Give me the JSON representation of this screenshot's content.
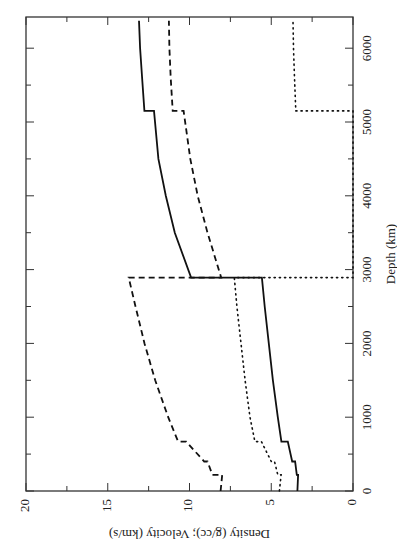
{
  "chart_data": {
    "type": "line",
    "title": "",
    "orientation": "rotated-90",
    "xlabel": "Depth (km)",
    "ylabel": "Density (g/cc); Velocity (km/s)",
    "xlim": [
      0,
      6371
    ],
    "ylim": [
      0,
      20
    ],
    "x_ticks": [
      0,
      1000,
      2000,
      3000,
      4000,
      5000,
      6000
    ],
    "x_tick_labels": [
      "0",
      "1000",
      "2000",
      "3000",
      "4000",
      "5000",
      "6000"
    ],
    "y_ticks": [
      0,
      5,
      10,
      15,
      20
    ],
    "y_tick_labels": [
      "0",
      "5",
      "10",
      "15",
      "20"
    ],
    "grid": false,
    "legend": null,
    "series": [
      {
        "name": "Density",
        "style": "solid",
        "points": [
          [
            0,
            3.4
          ],
          [
            220,
            3.36
          ],
          [
            220,
            3.44
          ],
          [
            400,
            3.54
          ],
          [
            400,
            3.72
          ],
          [
            670,
            3.99
          ],
          [
            670,
            4.38
          ],
          [
            1000,
            4.6
          ],
          [
            1500,
            4.9
          ],
          [
            2000,
            5.15
          ],
          [
            2500,
            5.4
          ],
          [
            2891,
            5.57
          ],
          [
            2891,
            9.9
          ],
          [
            3500,
            10.9
          ],
          [
            4000,
            11.45
          ],
          [
            4500,
            11.9
          ],
          [
            5150,
            12.17
          ],
          [
            5150,
            12.76
          ],
          [
            5600,
            12.9
          ],
          [
            6000,
            13.02
          ],
          [
            6371,
            13.09
          ]
        ]
      },
      {
        "name": "P-wave velocity",
        "style": "dashed",
        "points": [
          [
            0,
            8.1
          ],
          [
            220,
            8.0
          ],
          [
            220,
            8.6
          ],
          [
            400,
            8.9
          ],
          [
            400,
            9.1
          ],
          [
            670,
            10.2
          ],
          [
            670,
            10.7
          ],
          [
            1000,
            11.3
          ],
          [
            1500,
            12.1
          ],
          [
            2000,
            12.75
          ],
          [
            2500,
            13.3
          ],
          [
            2891,
            13.72
          ],
          [
            2891,
            8.06
          ],
          [
            3500,
            8.9
          ],
          [
            4000,
            9.5
          ],
          [
            4500,
            9.95
          ],
          [
            5150,
            10.36
          ],
          [
            5150,
            11.03
          ],
          [
            5600,
            11.15
          ],
          [
            6000,
            11.23
          ],
          [
            6371,
            11.26
          ]
        ]
      },
      {
        "name": "S-wave velocity",
        "style": "dotted",
        "points": [
          [
            0,
            4.5
          ],
          [
            220,
            4.4
          ],
          [
            220,
            4.6
          ],
          [
            400,
            4.8
          ],
          [
            400,
            5.0
          ],
          [
            670,
            5.6
          ],
          [
            670,
            6.0
          ],
          [
            1000,
            6.3
          ],
          [
            1500,
            6.6
          ],
          [
            2000,
            6.85
          ],
          [
            2500,
            7.1
          ],
          [
            2891,
            7.26
          ],
          [
            2891,
            0
          ],
          [
            5150,
            0
          ],
          [
            5150,
            3.5
          ],
          [
            5600,
            3.58
          ],
          [
            6000,
            3.64
          ],
          [
            6371,
            3.67
          ]
        ]
      }
    ]
  }
}
